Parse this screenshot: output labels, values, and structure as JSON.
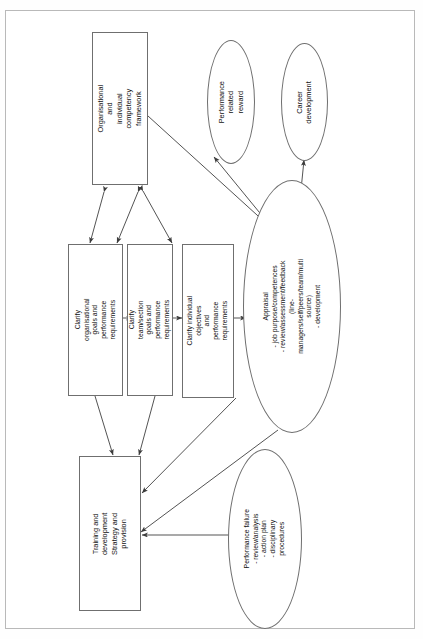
{
  "document": {
    "type": "flow-diagram",
    "orientation": "rotated-90-counterclockwise",
    "background_color": "#fefefe",
    "border_color": "#b9b9b9",
    "line_color": "#4a4a4a"
  },
  "nodes": {
    "competency_framework": {
      "shape": "rectangle",
      "label": "Organisational and\nindividual\ncompetency framework"
    },
    "performance_related_reward": {
      "shape": "ellipse",
      "label": "Performance related\nreward"
    },
    "career_development": {
      "shape": "ellipse",
      "label": "Career\ndevelopment"
    },
    "clarify_organisational": {
      "shape": "rectangle",
      "label": "Clarify organisational\ngoals and performance\nrequirements"
    },
    "clarify_team": {
      "shape": "rectangle",
      "label": "Clarify team/section\ngoals and performance\nrequirements"
    },
    "clarify_individual": {
      "shape": "rectangle",
      "label": "Clarify individual objectives\nand performance\nrequirements"
    },
    "appraisal": {
      "shape": "ellipse",
      "label": "Appraisal\n- job purpose/competences\n- review/assessment/feedback\n(line-managers/self/peers/team/multi source)\n- development"
    },
    "training_development": {
      "shape": "rectangle",
      "label": "Training and development\nStrategy and provision"
    },
    "performance_failure": {
      "shape": "ellipse",
      "label": "Performance failure\n- review/analysis\n- action plan\n- disciplinary procedures"
    }
  },
  "edges": [
    {
      "from": "clarify_organisational",
      "to": "clarify_team",
      "style": "single-arrow"
    },
    {
      "from": "clarify_team",
      "to": "clarify_individual",
      "style": "single-arrow"
    },
    {
      "from": "clarify_individual",
      "to": "appraisal",
      "style": "single-arrow"
    },
    {
      "from": "competency_framework",
      "to": "clarify_organisational",
      "style": "double-arrow"
    },
    {
      "from": "competency_framework",
      "to": "clarify_team",
      "style": "double-arrow"
    },
    {
      "from": "competency_framework",
      "to": "clarify_individual",
      "style": "double-arrow"
    },
    {
      "from": "competency_framework",
      "to": "appraisal",
      "style": "double-arrow"
    },
    {
      "from": "appraisal",
      "to": "performance_related_reward",
      "style": "double-arrow"
    },
    {
      "from": "appraisal",
      "to": "career_development",
      "style": "double-arrow"
    },
    {
      "from": "clarify_organisational",
      "to": "training_development",
      "style": "single-arrow"
    },
    {
      "from": "clarify_team",
      "to": "training_development",
      "style": "single-arrow"
    },
    {
      "from": "clarify_individual",
      "to": "training_development",
      "style": "single-arrow"
    },
    {
      "from": "appraisal",
      "to": "training_development",
      "style": "single-arrow"
    },
    {
      "from": "performance_failure",
      "to": "training_development",
      "style": "single-arrow"
    }
  ]
}
